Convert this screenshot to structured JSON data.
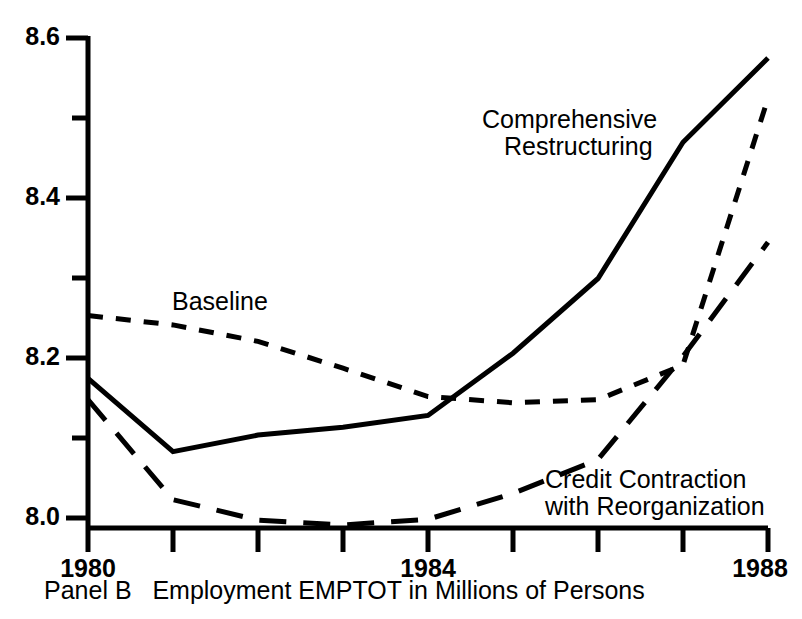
{
  "caption": "Panel B   Employment EMPTOT in Millions of Persons",
  "axes": {
    "y_tick_labels": [
      "8.6",
      "8.4",
      "8.2",
      "8.0"
    ],
    "x_tick_labels": [
      "1980",
      "1984",
      "1988"
    ]
  },
  "annotations": {
    "comprehensive_line1": "Comprehensive",
    "comprehensive_line2": "Restructuring",
    "baseline": "Baseline",
    "credit_line1": "Credit Contraction",
    "credit_line2": "with Reorganization"
  },
  "chart_data": {
    "type": "line",
    "title": "Panel B   Employment EMPTOT in Millions of Persons",
    "xlabel": "",
    "ylabel": "",
    "xlim": [
      1980,
      1988
    ],
    "ylim": [
      7.985,
      8.61
    ],
    "grid": false,
    "legend_position": "inline-annotations",
    "x": [
      1980,
      1981,
      1982,
      1983,
      1984,
      1985,
      1986,
      1987,
      1988
    ],
    "y_major_ticks": [
      8.0,
      8.2,
      8.4,
      8.6
    ],
    "y_minor_ticks": [
      8.1,
      8.3,
      8.5
    ],
    "x_ticks": [
      1980,
      1981,
      1982,
      1983,
      1984,
      1985,
      1986,
      1987,
      1988
    ],
    "x_labeled_ticks": [
      1980,
      1984,
      1988
    ],
    "series": [
      {
        "name": "Comprehensive Restructuring",
        "style": "solid",
        "color": "#000000",
        "values": [
          8.175,
          8.082,
          8.103,
          8.113,
          8.128,
          8.207,
          8.302,
          8.475,
          8.582
        ]
      },
      {
        "name": "Baseline",
        "style": "short-dash",
        "color": "#000000",
        "values": [
          8.255,
          8.243,
          8.222,
          8.188,
          8.152,
          8.144,
          8.148,
          8.192,
          8.531
        ]
      },
      {
        "name": "Credit Contraction with Reorganization",
        "style": "long-dash",
        "color": "#000000",
        "values": [
          8.148,
          8.021,
          7.995,
          7.989,
          7.996,
          8.029,
          8.072,
          8.203,
          8.348
        ]
      }
    ]
  }
}
